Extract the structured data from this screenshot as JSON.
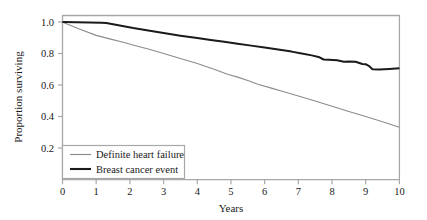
{
  "chart_data": {
    "type": "line",
    "title": "",
    "subtitle": "",
    "xlabel": "Years",
    "ylabel": "Proportion surviving",
    "xlim": [
      0,
      10
    ],
    "ylim": [
      0,
      1.05
    ],
    "xticks": [
      "0",
      "1",
      "2",
      "3",
      "4",
      "5",
      "6",
      "7",
      "8",
      "9",
      "10"
    ],
    "xtick_values": [
      0,
      1,
      2,
      3,
      4,
      5,
      6,
      7,
      8,
      9,
      10
    ],
    "yticks": [
      "0.2",
      "0.4",
      "0.6",
      "0.8",
      "1.0"
    ],
    "ytick_values": [
      0.2,
      0.4,
      0.6,
      0.8,
      1.0
    ],
    "grid": false,
    "legend_position": "lower left",
    "series": [
      {
        "name": "Definite heart failure",
        "color": "#8c8c8c",
        "width": 1.1,
        "x": [
          0.0,
          0.15,
          0.5,
          1.0,
          1.4,
          1.8,
          2.2,
          2.6,
          3.0,
          3.5,
          4.0,
          4.5,
          4.9,
          5.2,
          5.5,
          5.8,
          6.2,
          6.6,
          7.0,
          7.5,
          8.0,
          8.5,
          9.0,
          9.5,
          10.0
        ],
        "y": [
          1.0,
          0.985,
          0.955,
          0.915,
          0.893,
          0.872,
          0.848,
          0.825,
          0.8,
          0.768,
          0.736,
          0.7,
          0.668,
          0.65,
          0.628,
          0.605,
          0.58,
          0.556,
          0.53,
          0.498,
          0.465,
          0.432,
          0.4,
          0.367,
          0.332
        ]
      },
      {
        "name": "Breast cancer event",
        "color": "#1a1a1a",
        "width": 2.0,
        "x": [
          0.0,
          0.4,
          0.8,
          1.15,
          1.3,
          1.7,
          2.1,
          2.5,
          3.0,
          3.5,
          4.0,
          4.4,
          4.8,
          5.2,
          5.6,
          6.0,
          6.4,
          6.8,
          7.1,
          7.4,
          7.6,
          7.75,
          7.9,
          8.15,
          8.35,
          8.5,
          8.7,
          8.9,
          9.0,
          9.1,
          9.2,
          9.4,
          9.7,
          10.0
        ],
        "y": [
          1.0,
          0.998,
          0.997,
          0.996,
          0.993,
          0.978,
          0.962,
          0.948,
          0.93,
          0.913,
          0.898,
          0.886,
          0.874,
          0.862,
          0.85,
          0.838,
          0.826,
          0.812,
          0.8,
          0.788,
          0.778,
          0.762,
          0.76,
          0.757,
          0.748,
          0.75,
          0.748,
          0.733,
          0.732,
          0.72,
          0.7,
          0.698,
          0.702,
          0.706
        ]
      }
    ],
    "annotations": []
  },
  "legend": {
    "entries": [
      {
        "label": "Definite heart failure"
      },
      {
        "label": "Breast cancer event"
      }
    ]
  },
  "axes": {
    "x_title": "Years",
    "y_title": "Proportion surviving"
  },
  "colors": {
    "background": "#ffffff",
    "frame": "#a8a8a8",
    "text": "#1a1a1a",
    "series_gray": "#8c8c8c",
    "series_black": "#1a1a1a"
  }
}
